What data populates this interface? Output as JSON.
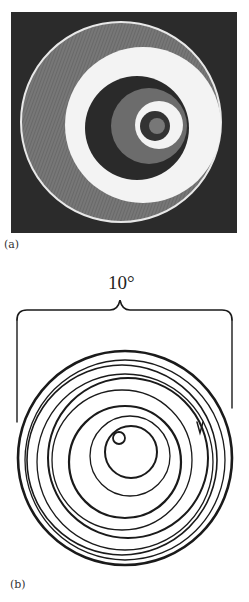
{
  "figure": {
    "panel_a": {
      "label": "(a)",
      "description": "Photograph of concentric spiral rings with radial striations on dark background"
    },
    "panel_b": {
      "label": "(b)",
      "description": "Line drawing of concentric spiral path with arrow",
      "scale_label": "10°"
    }
  },
  "colors": {
    "background": "#ffffff",
    "panel_a_bg": "#2b2b2b",
    "ring_gray": "#7a7a7a",
    "ring_light": "#f2f2f2",
    "ink": "#1a1a1a"
  }
}
